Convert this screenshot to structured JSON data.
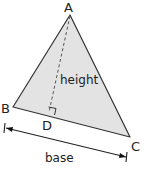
{
  "diagram": {
    "vertices": {
      "A": {
        "label": "A",
        "x": 70,
        "y": 15
      },
      "B": {
        "label": "B",
        "x": 13,
        "y": 107
      },
      "C": {
        "label": "C",
        "x": 130,
        "y": 137
      },
      "D": {
        "label": "D",
        "x": 49,
        "y": 113
      }
    },
    "labels": {
      "height": "height",
      "base": "base"
    },
    "colors": {
      "fill": "#e3e3e3",
      "stroke": "#333333",
      "text": "#222222"
    }
  }
}
